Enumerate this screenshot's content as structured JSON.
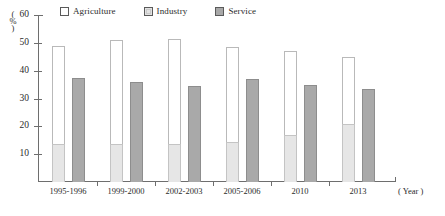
{
  "chart_data": {
    "type": "bar",
    "title": "",
    "subtitle": "",
    "xlabel": "(Year)",
    "ylabel": "(%)",
    "ylim": [
      0,
      60
    ],
    "y_ticks": [
      0,
      10,
      20,
      30,
      40,
      50,
      60
    ],
    "grid": false,
    "legend_position": "top",
    "categories": [
      "1995-1996",
      "1999-2000",
      "2002-2003",
      "2005-2006",
      "2010",
      "2013"
    ],
    "series": [
      {
        "name": "Agriculture",
        "color": "#ffffff",
        "values": [
          49,
          51,
          51.5,
          48.5,
          47,
          45
        ]
      },
      {
        "name": "Industry",
        "color": "#e6e6e6",
        "values": [
          13.5,
          13.5,
          13.5,
          14.5,
          17,
          21
        ]
      },
      {
        "name": "Service",
        "color": "#a9a9a9",
        "values": [
          37.5,
          36,
          34.5,
          37,
          35,
          33.5
        ]
      }
    ]
  },
  "legend": {
    "entries": [
      {
        "label": "Agriculture",
        "swatch": "agriculture-swatch-icon"
      },
      {
        "label": "Industry",
        "swatch": "industry-swatch-icon"
      },
      {
        "label": "Service",
        "swatch": "service-swatch-icon"
      }
    ]
  },
  "axes": {
    "y_unit_top": "(",
    "y_unit_symbol": "%",
    "y_unit_bottom": ")",
    "y_tick_labels": [
      "60",
      "50",
      "40",
      "30",
      "20",
      "10"
    ],
    "x_tick_labels": [
      "1995-1996",
      "1999-2000",
      "2002-2003",
      "2005-2006",
      "2010",
      "2013"
    ],
    "x_unit": "( Year )"
  }
}
